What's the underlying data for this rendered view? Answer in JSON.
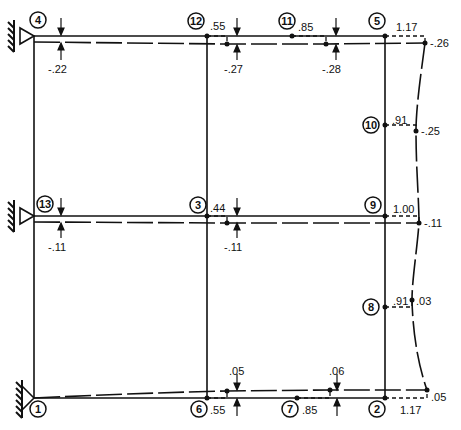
{
  "diagram": {
    "type": "frame-deflection",
    "nodes": [
      {
        "id": "1",
        "label": "1"
      },
      {
        "id": "2",
        "label": "2"
      },
      {
        "id": "3",
        "label": "3"
      },
      {
        "id": "4",
        "label": "4"
      },
      {
        "id": "5",
        "label": "5"
      },
      {
        "id": "6",
        "label": "6"
      },
      {
        "id": "7",
        "label": "7"
      },
      {
        "id": "8",
        "label": "8"
      },
      {
        "id": "9",
        "label": "9"
      },
      {
        "id": "10",
        "label": "10"
      },
      {
        "id": "11",
        "label": "11"
      },
      {
        "id": "12",
        "label": "12"
      },
      {
        "id": "13",
        "label": "13"
      }
    ],
    "values": {
      "top_left_vertical": "-.22",
      "node12_horizontal": ".55",
      "top_mid_vertical": "-.27",
      "node11_horizontal": ".85",
      "top_right_mid_vertical": "-.28",
      "node5_horizontal": "1.17",
      "top_right_corner": "-.26",
      "node10_horizontal": ".91",
      "right_upper_mid": "-.25",
      "node13_vertical": "-.11",
      "node3_horizontal": ".44",
      "mid_vertical": "-.11",
      "node9_horizontal": "1.00",
      "mid_right_corner": "-.11",
      "node8_horizontal": ".91",
      "right_lower_mid": ".03",
      "bottom_mid_vertical": ".05",
      "node6_horizontal": ".55",
      "bottom_right_mid_vertical": ".06",
      "node7_horizontal": ".85",
      "node2_horizontal": "1.17",
      "bottom_right_corner": ".05"
    }
  }
}
